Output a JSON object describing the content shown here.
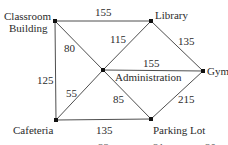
{
  "diagram": {
    "type": "weighted-graph",
    "colors": {
      "edge": "#3a3a3a",
      "node": "#111111",
      "text": "#2b2b2b"
    },
    "nodes": {
      "classroom": {
        "label_line1": "Classroom",
        "label_line2": "Building"
      },
      "library": {
        "label": "Library"
      },
      "gym": {
        "label": "Gym"
      },
      "administration": {
        "label": "Administration"
      },
      "cafeteria": {
        "label": "Cafeteria"
      },
      "parking": {
        "label": "Parking Lot"
      }
    },
    "edges": {
      "classroom_library": {
        "from": "Classroom Building",
        "to": "Library",
        "weight": "155"
      },
      "classroom_admin": {
        "from": "Classroom Building",
        "to": "Administration",
        "weight": "80"
      },
      "classroom_cafeteria": {
        "from": "Classroom Building",
        "to": "Cafeteria",
        "weight": "125"
      },
      "library_admin": {
        "from": "Library",
        "to": "Administration",
        "weight": "115"
      },
      "library_gym": {
        "from": "Library",
        "to": "Gym",
        "weight": "135"
      },
      "admin_gym": {
        "from": "Administration",
        "to": "Gym",
        "weight": "155"
      },
      "cafeteria_admin": {
        "from": "Cafeteria",
        "to": "Administration",
        "weight": "55"
      },
      "parking_admin": {
        "from": "Parking Lot",
        "to": "Administration",
        "weight": "85"
      },
      "cafeteria_parking": {
        "from": "Cafeteria",
        "to": "Parking Lot",
        "weight": "135"
      },
      "parking_gym": {
        "from": "Parking Lot",
        "to": "Gym",
        "weight": "215"
      }
    },
    "cutoff_text": [
      "22",
      "21",
      "20"
    ]
  }
}
